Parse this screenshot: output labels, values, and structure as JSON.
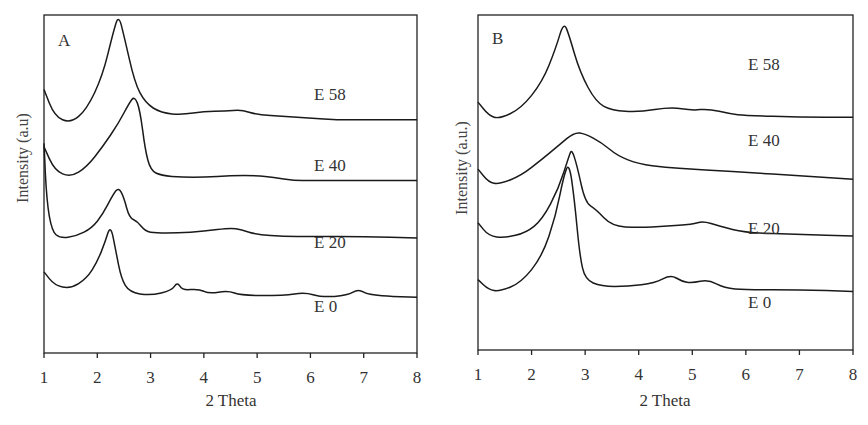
{
  "chart_data": [
    {
      "type": "line",
      "panel_label": "A",
      "xlabel": "2 Theta",
      "ylabel": "Intensity (a.u)",
      "xlim": [
        1,
        8
      ],
      "xticks": [
        "1",
        "2",
        "3",
        "4",
        "5",
        "6",
        "7",
        "8"
      ],
      "grid": false,
      "legend": "inline labels on right",
      "series": [
        {
          "name": "E 58",
          "peaks_2theta": [
            2.4,
            4.7
          ],
          "main_peak": 2.4,
          "points": [
            [
              1.0,
              0.78
            ],
            [
              1.2,
              0.7
            ],
            [
              1.5,
              0.68
            ],
            [
              1.8,
              0.72
            ],
            [
              2.1,
              0.82
            ],
            [
              2.3,
              0.95
            ],
            [
              2.4,
              1.0
            ],
            [
              2.5,
              0.94
            ],
            [
              2.7,
              0.8
            ],
            [
              2.9,
              0.74
            ],
            [
              3.2,
              0.71
            ],
            [
              3.6,
              0.705
            ],
            [
              4.0,
              0.715
            ],
            [
              4.4,
              0.715
            ],
            [
              4.7,
              0.72
            ],
            [
              5.0,
              0.705
            ],
            [
              5.5,
              0.7
            ],
            [
              6.0,
              0.695
            ],
            [
              6.5,
              0.69
            ],
            [
              7.0,
              0.69
            ],
            [
              7.5,
              0.69
            ],
            [
              8.0,
              0.69
            ]
          ]
        },
        {
          "name": "E 40",
          "peaks_2theta": [
            2.7,
            5.1
          ],
          "main_peak": 2.7,
          "points": [
            [
              1.0,
              0.61
            ],
            [
              1.2,
              0.54
            ],
            [
              1.5,
              0.52
            ],
            [
              1.8,
              0.55
            ],
            [
              2.1,
              0.61
            ],
            [
              2.4,
              0.68
            ],
            [
              2.6,
              0.74
            ],
            [
              2.7,
              0.76
            ],
            [
              2.8,
              0.72
            ],
            [
              2.9,
              0.6
            ],
            [
              3.0,
              0.54
            ],
            [
              3.2,
              0.525
            ],
            [
              3.6,
              0.52
            ],
            [
              4.0,
              0.52
            ],
            [
              4.5,
              0.525
            ],
            [
              5.0,
              0.525
            ],
            [
              5.3,
              0.52
            ],
            [
              5.7,
              0.51
            ],
            [
              6.0,
              0.51
            ],
            [
              7.0,
              0.51
            ],
            [
              8.0,
              0.51
            ]
          ]
        },
        {
          "name": "E 20",
          "peaks_2theta": [
            2.4,
            2.8,
            4.6
          ],
          "main_peak": 2.4,
          "points": [
            [
              1.0,
              0.62
            ],
            [
              1.05,
              0.45
            ],
            [
              1.15,
              0.36
            ],
            [
              1.3,
              0.34
            ],
            [
              1.6,
              0.345
            ],
            [
              1.9,
              0.37
            ],
            [
              2.1,
              0.41
            ],
            [
              2.3,
              0.47
            ],
            [
              2.4,
              0.49
            ],
            [
              2.5,
              0.46
            ],
            [
              2.6,
              0.4
            ],
            [
              2.75,
              0.39
            ],
            [
              2.9,
              0.36
            ],
            [
              3.1,
              0.355
            ],
            [
              3.5,
              0.355
            ],
            [
              4.0,
              0.36
            ],
            [
              4.5,
              0.37
            ],
            [
              4.7,
              0.365
            ],
            [
              5.0,
              0.35
            ],
            [
              5.5,
              0.345
            ],
            [
              6.0,
              0.345
            ],
            [
              7.0,
              0.345
            ],
            [
              8.0,
              0.34
            ]
          ]
        },
        {
          "name": "E 0",
          "peaks_2theta": [
            2.25,
            3.5,
            3.9,
            4.45,
            5.9,
            6.9
          ],
          "main_peak": 2.25,
          "points": [
            [
              1.0,
              0.24
            ],
            [
              1.2,
              0.2
            ],
            [
              1.5,
              0.19
            ],
            [
              1.8,
              0.22
            ],
            [
              2.0,
              0.27
            ],
            [
              2.15,
              0.33
            ],
            [
              2.25,
              0.38
            ],
            [
              2.35,
              0.3
            ],
            [
              2.45,
              0.22
            ],
            [
              2.6,
              0.18
            ],
            [
              3.0,
              0.17
            ],
            [
              3.4,
              0.185
            ],
            [
              3.5,
              0.21
            ],
            [
              3.6,
              0.185
            ],
            [
              3.9,
              0.19
            ],
            [
              4.1,
              0.175
            ],
            [
              4.45,
              0.185
            ],
            [
              4.7,
              0.17
            ],
            [
              5.5,
              0.17
            ],
            [
              5.9,
              0.18
            ],
            [
              6.2,
              0.165
            ],
            [
              6.7,
              0.17
            ],
            [
              6.9,
              0.19
            ],
            [
              7.1,
              0.17
            ],
            [
              8.0,
              0.165
            ]
          ]
        }
      ]
    },
    {
      "type": "line",
      "panel_label": "B",
      "xlabel": "2 Theta",
      "ylabel": "Intensity (a.u.)",
      "xlim": [
        1,
        8
      ],
      "xticks": [
        "1",
        "2",
        "3",
        "4",
        "5",
        "6",
        "7",
        "8"
      ],
      "grid": false,
      "legend": "inline labels on right",
      "series": [
        {
          "name": "E 58",
          "peaks_2theta": [
            2.6,
            4.6,
            5.3
          ],
          "main_peak": 2.6,
          "points": [
            [
              1.0,
              0.74
            ],
            [
              1.2,
              0.7
            ],
            [
              1.4,
              0.69
            ],
            [
              1.8,
              0.72
            ],
            [
              2.2,
              0.8
            ],
            [
              2.45,
              0.9
            ],
            [
              2.6,
              0.98
            ],
            [
              2.7,
              0.94
            ],
            [
              2.9,
              0.83
            ],
            [
              3.2,
              0.74
            ],
            [
              3.5,
              0.715
            ],
            [
              4.0,
              0.71
            ],
            [
              4.6,
              0.725
            ],
            [
              5.0,
              0.715
            ],
            [
              5.3,
              0.72
            ],
            [
              5.7,
              0.705
            ],
            [
              6.0,
              0.7
            ],
            [
              7.0,
              0.695
            ],
            [
              8.0,
              0.695
            ]
          ]
        },
        {
          "name": "E 40",
          "peaks_2theta": [
            2.85,
            3.2
          ],
          "main_peak": 2.85,
          "points": [
            [
              1.0,
              0.54
            ],
            [
              1.2,
              0.5
            ],
            [
              1.4,
              0.495
            ],
            [
              1.8,
              0.52
            ],
            [
              2.2,
              0.57
            ],
            [
              2.5,
              0.61
            ],
            [
              2.8,
              0.65
            ],
            [
              3.0,
              0.645
            ],
            [
              3.3,
              0.62
            ],
            [
              3.6,
              0.58
            ],
            [
              4.0,
              0.555
            ],
            [
              4.5,
              0.545
            ],
            [
              5.0,
              0.54
            ],
            [
              5.5,
              0.535
            ],
            [
              6.0,
              0.53
            ],
            [
              7.0,
              0.52
            ],
            [
              8.0,
              0.51
            ]
          ]
        },
        {
          "name": "E 20",
          "peaks_2theta": [
            2.75,
            3.2,
            5.2
          ],
          "main_peak": 2.75,
          "points": [
            [
              1.0,
              0.38
            ],
            [
              1.2,
              0.34
            ],
            [
              1.5,
              0.335
            ],
            [
              1.9,
              0.35
            ],
            [
              2.2,
              0.39
            ],
            [
              2.5,
              0.48
            ],
            [
              2.7,
              0.58
            ],
            [
              2.75,
              0.6
            ],
            [
              2.85,
              0.55
            ],
            [
              3.0,
              0.44
            ],
            [
              3.2,
              0.42
            ],
            [
              3.5,
              0.37
            ],
            [
              4.0,
              0.365
            ],
            [
              4.5,
              0.37
            ],
            [
              5.0,
              0.375
            ],
            [
              5.2,
              0.385
            ],
            [
              5.5,
              0.37
            ],
            [
              6.0,
              0.35
            ],
            [
              7.0,
              0.345
            ],
            [
              8.0,
              0.34
            ]
          ]
        },
        {
          "name": "E 0",
          "peaks_2theta": [
            2.7,
            4.6,
            5.3
          ],
          "main_peak": 2.7,
          "points": [
            [
              1.0,
              0.21
            ],
            [
              1.2,
              0.18
            ],
            [
              1.4,
              0.175
            ],
            [
              1.8,
              0.2
            ],
            [
              2.2,
              0.28
            ],
            [
              2.45,
              0.4
            ],
            [
              2.6,
              0.52
            ],
            [
              2.7,
              0.56
            ],
            [
              2.8,
              0.45
            ],
            [
              2.9,
              0.28
            ],
            [
              3.0,
              0.21
            ],
            [
              3.3,
              0.19
            ],
            [
              3.8,
              0.19
            ],
            [
              4.3,
              0.2
            ],
            [
              4.6,
              0.225
            ],
            [
              4.8,
              0.205
            ],
            [
              5.0,
              0.2
            ],
            [
              5.3,
              0.21
            ],
            [
              5.6,
              0.185
            ],
            [
              6.0,
              0.18
            ],
            [
              7.0,
              0.18
            ],
            [
              8.0,
              0.175
            ]
          ]
        }
      ]
    }
  ],
  "panels": [
    {
      "label": "A",
      "xlabel": "2 Theta",
      "ylabel": "Intensity (a.u)",
      "ticks": [
        "1",
        "2",
        "3",
        "4",
        "5",
        "6",
        "7",
        "8"
      ],
      "series_labels": [
        "E 58",
        "E 40",
        "E 20",
        "E 0"
      ]
    },
    {
      "label": "B",
      "xlabel": "2 Theta",
      "ylabel": "Intensity (a.u.)",
      "ticks": [
        "1",
        "2",
        "3",
        "4",
        "5",
        "6",
        "7",
        "8"
      ],
      "series_labels": [
        "E 58",
        "E 40",
        "E 20",
        "E 0"
      ]
    }
  ]
}
